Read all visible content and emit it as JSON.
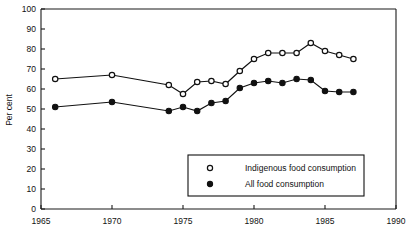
{
  "chart_data": {
    "type": "line",
    "title": "",
    "xlabel": "",
    "ylabel": "Per cent",
    "xlim": [
      1965,
      1990
    ],
    "ylim": [
      0,
      100
    ],
    "xticks": [
      1965,
      1970,
      1975,
      1980,
      1985,
      1990
    ],
    "yticks": [
      0,
      10,
      20,
      30,
      40,
      50,
      60,
      70,
      80,
      90,
      100
    ],
    "grid": false,
    "legend_position": "lower right",
    "series": [
      {
        "name": "Indigenous food consumption",
        "marker": "open-circle",
        "x": [
          1966,
          1970,
          1974,
          1975,
          1976,
          1977,
          1978,
          1979,
          1980,
          1981,
          1982,
          1983,
          1984,
          1985,
          1986,
          1987
        ],
        "values": [
          65,
          67,
          62,
          57.5,
          63.5,
          64,
          62.5,
          69,
          75,
          78,
          78,
          78,
          83,
          79,
          77,
          75
        ]
      },
      {
        "name": "All food consumption",
        "marker": "filled-circle",
        "x": [
          1966,
          1970,
          1974,
          1975,
          1976,
          1977,
          1978,
          1979,
          1980,
          1981,
          1982,
          1983,
          1984,
          1985,
          1986,
          1987
        ],
        "values": [
          51,
          53.5,
          49,
          51,
          49,
          53,
          54,
          60.5,
          63,
          64,
          63,
          65,
          64.5,
          59,
          58.5,
          58.5
        ]
      }
    ]
  },
  "axis": {
    "y_title": "Per cent",
    "y_tick_labels": [
      "0",
      "10",
      "20",
      "30",
      "40",
      "50",
      "60",
      "70",
      "80",
      "90",
      "100"
    ],
    "x_tick_labels": [
      "1965",
      "1970",
      "1975",
      "1980",
      "1985",
      "1990"
    ]
  },
  "legend": {
    "entries": [
      {
        "label": "Indigenous food consumption",
        "marker": "open-circle"
      },
      {
        "label": "All food consumption",
        "marker": "filled-circle"
      }
    ]
  }
}
